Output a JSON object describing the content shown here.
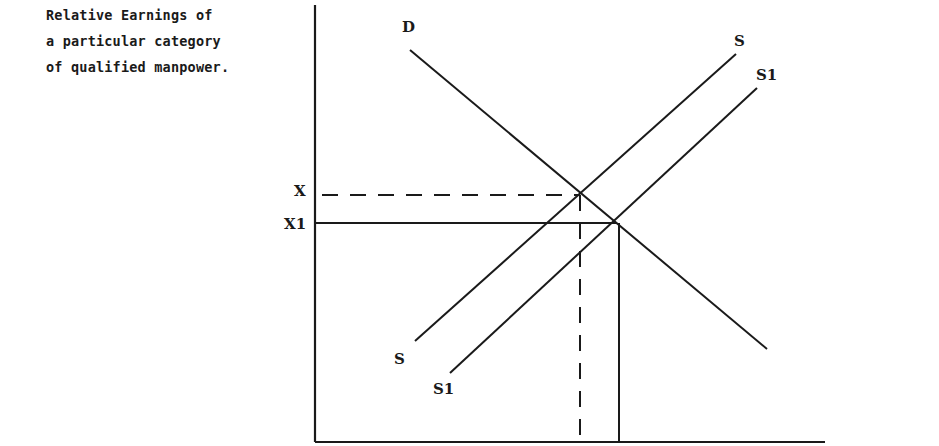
{
  "diagram": {
    "y_axis_label_lines": [
      "Relative Earnings of",
      "a particular category",
      "of qualified manpower."
    ],
    "curve_labels": {
      "demand": "D",
      "supply_upper": "S",
      "supply_upper_lower_end": "S",
      "supply_shifted_upper": "S1",
      "supply_shifted_lower_end": "S1"
    },
    "tick_labels": {
      "x": "X",
      "x1": "X1"
    },
    "colors": {
      "ink": "#1a1a1a",
      "background": "#ffffff"
    }
  }
}
